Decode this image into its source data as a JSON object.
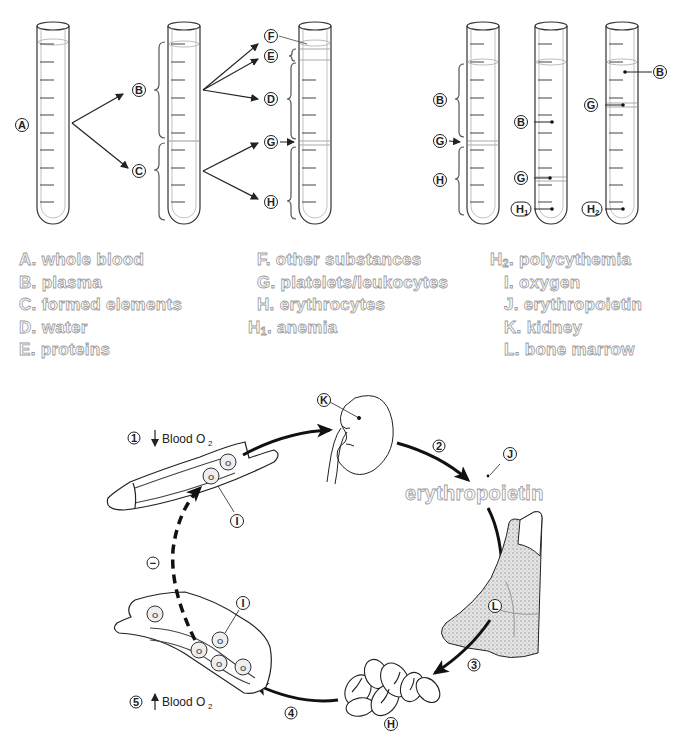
{
  "tube_labels": {
    "A": "A",
    "B": "B",
    "C": "C",
    "D": "D",
    "E": "E",
    "F": "F",
    "G": "G",
    "H": "H",
    "H1": "H",
    "H1_sub": "1",
    "H2": "H",
    "H2_sub": "2",
    "I": "I",
    "J": "J",
    "K": "K",
    "L": "L"
  },
  "legend": {
    "col1": [
      {
        "key": "A.",
        "text": "whole blood"
      },
      {
        "key": "B.",
        "text": "plasma"
      },
      {
        "key": "C.",
        "text": "formed elements"
      },
      {
        "key": "D.",
        "text": "water"
      },
      {
        "key": "E.",
        "text": "proteins"
      }
    ],
    "col2": [
      {
        "key": "F.",
        "text": "other substances"
      },
      {
        "key": "G.",
        "text": "platelets/leukocytes"
      },
      {
        "key": "H.",
        "text": "erythrocytes"
      },
      {
        "key": "H",
        "sub": "1",
        "dot": ".",
        "text": "anemia"
      }
    ],
    "col3": [
      {
        "key": "H",
        "sub": "2",
        "dot": ".",
        "text": "polycythemia"
      },
      {
        "key": "I.",
        "text": "oxygen"
      },
      {
        "key": "J.",
        "text": "erythropoietin"
      },
      {
        "key": "K.",
        "text": "kidney"
      },
      {
        "key": "L.",
        "text": "bone marrow"
      }
    ]
  },
  "cycle": {
    "step1_num": "1",
    "step1_text": "Blood O",
    "step1_sub": "2",
    "step2_num": "2",
    "step3_num": "3",
    "step4_num": "4",
    "step5_num": "5",
    "step5_text": "Blood O",
    "step5_sub": "2",
    "hormone_label": "erythropoietin",
    "o2_text": "O",
    "o2_sub": "2",
    "negative_feedback": "−"
  }
}
